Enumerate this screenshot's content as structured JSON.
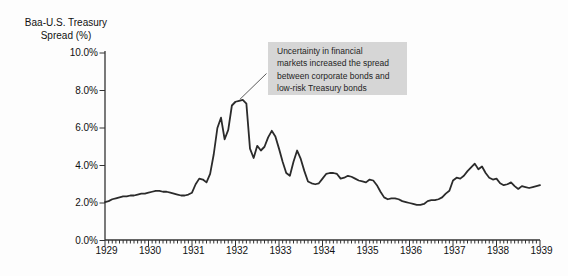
{
  "chart_data": {
    "type": "line",
    "title": "Baa-U.S. Treasury Spread (%)",
    "y_axis_title_lines": [
      "Baa-U.S. Treasury",
      "Spread (%)"
    ],
    "ylim": [
      0,
      10
    ],
    "y_tick_labels": [
      "10.0%",
      "8.0%",
      "6.0%",
      "4.0%",
      "2.0%",
      "0.0%"
    ],
    "y_tick_values": [
      10,
      8,
      6,
      4,
      2,
      0
    ],
    "x_tick_labels": [
      "1929",
      "1930",
      "1931",
      "1932",
      "1933",
      "1934",
      "1935",
      "1936",
      "1937",
      "1938",
      "1939"
    ],
    "x_frequency": "monthly",
    "x_start": "1929-01",
    "grid": false,
    "line_color": "#2b2b2b",
    "axis_color": "#333333",
    "annotation": {
      "lines": [
        "Uncertainty in financial",
        "markets increased the spread",
        "between corporate bonds and",
        "low-risk Treasury bonds"
      ],
      "text": "Uncertainty in financial markets increased the spread between corporate bonds and low-risk Treasury bonds",
      "background": "#d6d6d6",
      "target": {
        "year": 1932.1,
        "value": 7.5
      }
    },
    "series": [
      {
        "name": "Baa-U.S. Treasury spread (%)",
        "values": [
          2.05,
          2.1,
          2.2,
          2.25,
          2.3,
          2.35,
          2.35,
          2.4,
          2.4,
          2.45,
          2.5,
          2.5,
          2.55,
          2.6,
          2.65,
          2.65,
          2.6,
          2.6,
          2.55,
          2.5,
          2.45,
          2.4,
          2.4,
          2.45,
          2.55,
          3.0,
          3.3,
          3.25,
          3.1,
          3.55,
          4.6,
          6.0,
          6.55,
          5.4,
          5.9,
          7.2,
          7.4,
          7.45,
          7.5,
          7.3,
          4.9,
          4.4,
          5.05,
          4.8,
          5.0,
          5.5,
          5.85,
          5.55,
          4.9,
          4.2,
          3.6,
          3.45,
          4.2,
          4.8,
          4.35,
          3.7,
          3.15,
          3.05,
          3.0,
          3.05,
          3.3,
          3.55,
          3.6,
          3.6,
          3.55,
          3.3,
          3.35,
          3.45,
          3.4,
          3.3,
          3.2,
          3.15,
          3.1,
          3.25,
          3.2,
          2.95,
          2.6,
          2.3,
          2.2,
          2.25,
          2.25,
          2.2,
          2.1,
          2.05,
          2.0,
          1.95,
          1.9,
          1.9,
          1.95,
          2.1,
          2.15,
          2.15,
          2.2,
          2.3,
          2.5,
          2.65,
          3.2,
          3.35,
          3.3,
          3.45,
          3.7,
          3.9,
          4.1,
          3.8,
          3.95,
          3.6,
          3.35,
          3.25,
          3.3,
          3.05,
          2.95,
          3.0,
          3.1,
          2.9,
          2.75,
          2.9,
          2.85,
          2.8,
          2.85,
          2.9,
          2.95
        ]
      }
    ]
  }
}
